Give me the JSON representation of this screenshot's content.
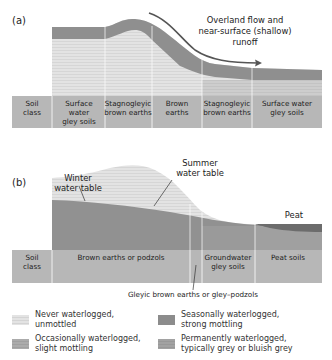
{
  "panel_a": {
    "label": "(a)",
    "annotation": "Overland flow and\nnear-surface (shallow)\nrunoff",
    "annotation_lines": [
      "Overland flow and",
      "near-surface (shallow)",
      "runoff"
    ],
    "soil_class_header": [
      "Soil",
      "class"
    ],
    "columns": [
      {
        "lines": [
          "Surface",
          "water",
          "gley soils"
        ]
      },
      {
        "lines": [
          "Stagnogleyic",
          "brown earths"
        ]
      },
      {
        "lines": [
          "Brown",
          "earths"
        ]
      },
      {
        "lines": [
          "Stagnogleyic",
          "brown earths"
        ]
      },
      {
        "lines": [
          "Surface water",
          "gley soils"
        ]
      }
    ]
  },
  "panel_b": {
    "label": "(b)",
    "winter_label": [
      "Winter",
      "water table"
    ],
    "summer_label": [
      "Summer",
      "water table"
    ],
    "peat_label": "Peat",
    "soil_class_header": [
      "Soil",
      "class"
    ],
    "columns": [
      {
        "lines": [
          "Brown earths or podzols"
        ]
      },
      {
        "lines": [
          ""
        ]
      },
      {
        "lines": [
          "Groundwater",
          "gley soils"
        ]
      },
      {
        "lines": [
          "Peat soils"
        ]
      }
    ],
    "callout": "Gleyic brown earths or gley–podzols"
  },
  "legend": [
    {
      "key": "never",
      "text": "Never waterlogged,\nunmottled",
      "color": "#e2e2e2"
    },
    {
      "key": "seasonal",
      "text": "Seasonally waterlogged,\nstrong mottling",
      "color": "#8a8a8a"
    },
    {
      "key": "occasional",
      "text": "Occasionally waterlogged,\nslight mottling",
      "color": "#a9a9a9"
    },
    {
      "key": "permanent",
      "text": "Permanently waterlogged,\ntypically grey or bluish grey",
      "color": "#9c9c9c"
    }
  ],
  "colors": {
    "never": "#e2e2e2",
    "occasional": "#b3b3b3",
    "seasonal": "#8e8e8e",
    "permanent": "#a3a3a3",
    "soil_row": "#b5b5b5",
    "peat": "#6e6e6e",
    "arrow": "#555555"
  }
}
